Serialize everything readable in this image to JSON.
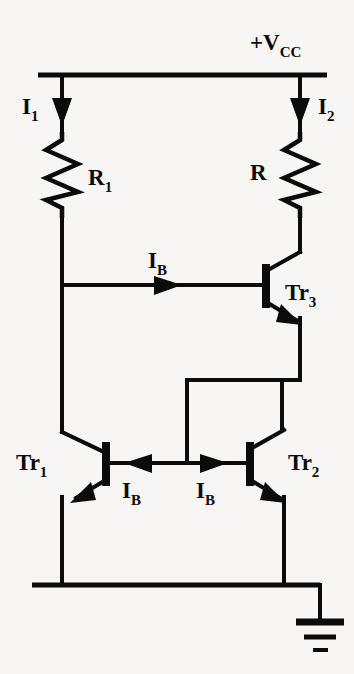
{
  "figure": {
    "type": "circuit-schematic",
    "background_color": "#f7f6f4",
    "line_color": "#0b0b0b"
  },
  "labels": {
    "supply": {
      "name": "supply-rail-label",
      "text": "+V",
      "subscript": "CC"
    },
    "current_i1": {
      "name": "current-i1-label",
      "text": "I",
      "subscript": "1"
    },
    "current_i2": {
      "name": "current-i2-label",
      "text": "I",
      "subscript": "2"
    },
    "resistor_r1": {
      "name": "resistor-r1-label",
      "text": "R",
      "subscript": "1"
    },
    "resistor_r": {
      "name": "resistor-r-label",
      "text": "R",
      "subscript": ""
    },
    "transistor_tr1": {
      "name": "transistor-tr1-label",
      "text": "Tr",
      "subscript": "1"
    },
    "transistor_tr2": {
      "name": "transistor-tr2-label",
      "text": "Tr",
      "subscript": "2"
    },
    "transistor_tr3": {
      "name": "transistor-tr3-label",
      "text": "Tr",
      "subscript": "3"
    },
    "base_current_top": {
      "name": "base-current-tr3-label",
      "text": "I",
      "subscript": "B"
    },
    "base_current_left": {
      "name": "base-current-tr1-label",
      "text": "I",
      "subscript": "B"
    },
    "base_current_right": {
      "name": "base-current-tr2-label",
      "text": "I",
      "subscript": "B"
    }
  },
  "components": [
    {
      "id": "R1",
      "type": "resistor",
      "label": "R1",
      "branch": "left",
      "current": "I1"
    },
    {
      "id": "R",
      "type": "resistor",
      "label": "R",
      "branch": "right",
      "current": "I2"
    },
    {
      "id": "Tr1",
      "type": "npn-transistor",
      "label": "Tr1",
      "orientation": "mirrored"
    },
    {
      "id": "Tr2",
      "type": "npn-transistor",
      "label": "Tr2",
      "orientation": "normal"
    },
    {
      "id": "Tr3",
      "type": "npn-transistor",
      "label": "Tr3",
      "orientation": "normal"
    },
    {
      "id": "GND",
      "type": "ground-symbol",
      "label": "",
      "bars": 3
    }
  ],
  "currents": [
    {
      "name": "I1",
      "direction": "down",
      "branch": "left"
    },
    {
      "name": "I2",
      "direction": "down",
      "branch": "right"
    },
    {
      "name": "IB",
      "direction": "right",
      "location": "tr3-base"
    },
    {
      "name": "IB",
      "direction": "left",
      "location": "tr1-base"
    },
    {
      "name": "IB",
      "direction": "right",
      "location": "tr2-base"
    }
  ]
}
